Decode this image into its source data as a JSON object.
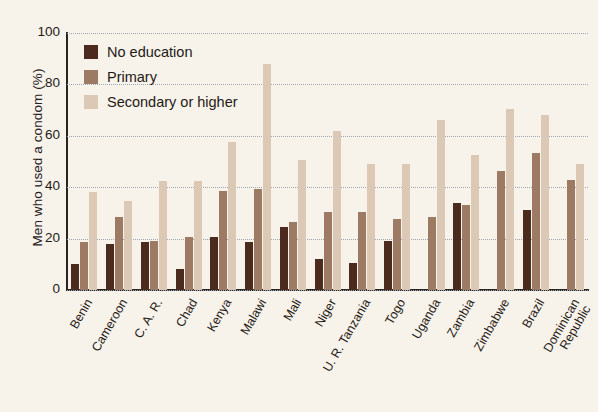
{
  "chart_data": {
    "type": "bar",
    "title": "",
    "subtitle": "",
    "xlabel": "",
    "ylabel": "Men who used a condom (%)",
    "ylim": [
      0,
      100
    ],
    "yticks": [
      0,
      20,
      40,
      60,
      80,
      100
    ],
    "grid": true,
    "legend_position": "top-left",
    "categories": [
      "Benin",
      "Cameroon",
      "C. A. R.",
      "Chad",
      "Kenya",
      "Malawi",
      "Mali",
      "Niger",
      "U. R. Tanzania",
      "Togo",
      "Uganda",
      "Zambia",
      "Zimbabwe",
      "Brazil",
      "Dominican Republic"
    ],
    "series": [
      {
        "name": "No education",
        "color": "#4a2b1d",
        "values": [
          10,
          18,
          18.5,
          8,
          20.5,
          18.5,
          24.5,
          12,
          10.5,
          19,
          null,
          34,
          null,
          31,
          null
        ]
      },
      {
        "name": "Primary",
        "color": "#9c7a63",
        "values": [
          18.5,
          28.5,
          19,
          20.5,
          38.5,
          39.5,
          26.5,
          30.5,
          30.5,
          27.5,
          28.5,
          33,
          46.5,
          53.5,
          43
        ]
      },
      {
        "name": "Secondary or higher",
        "color": "#dcc9b5",
        "values": [
          38,
          34.5,
          42.5,
          42.5,
          57.5,
          88,
          50.5,
          62,
          49,
          49,
          66,
          52.5,
          70.5,
          68,
          49
        ]
      }
    ]
  },
  "legend": {
    "items": [
      {
        "label": "No education",
        "color": "#4a2b1d"
      },
      {
        "label": "Primary",
        "color": "#9c7a63"
      },
      {
        "label": "Secondary or higher",
        "color": "#dcc9b5"
      }
    ]
  },
  "axis": {
    "y_title": "Men who used a condom (%)",
    "y_tick_labels": [
      "100",
      "80",
      "60",
      "40",
      "20",
      "0"
    ]
  }
}
